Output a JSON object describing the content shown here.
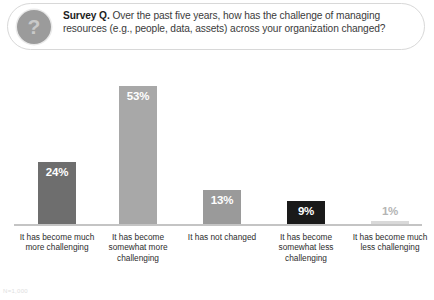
{
  "question": {
    "badge_icon": "question-mark-icon",
    "prefix": "Survey Q.",
    "body": " Over the past five years, how has the challenge of managing resources (e.g., people, data, assets) across your organization changed?"
  },
  "footnote": "N=1,000",
  "chart_data": {
    "type": "bar",
    "title": "",
    "xlabel": "",
    "ylabel": "",
    "ylim": [
      0,
      60
    ],
    "grid": false,
    "legend": "none",
    "categories": [
      "It has become much more challenging",
      "It has become somewhat more challenging",
      "It has not changed",
      "It has become somewhat less challenging",
      "It has become much less challenging"
    ],
    "values": [
      24,
      53,
      13,
      9,
      1
    ],
    "value_labels": [
      "24%",
      "53%",
      "13%",
      "9%",
      "1%"
    ],
    "bar_colors": [
      "#6e6e6e",
      "#a8a8a8",
      "#9a9a9a",
      "#1a1a1a",
      "#d9d9d9"
    ],
    "label_colors": [
      "#ffffff",
      "#ffffff",
      "#ffffff",
      "#ffffff",
      "#b4b4b4"
    ],
    "label_placement": [
      "inside",
      "inside",
      "inside",
      "inside",
      "above"
    ]
  }
}
